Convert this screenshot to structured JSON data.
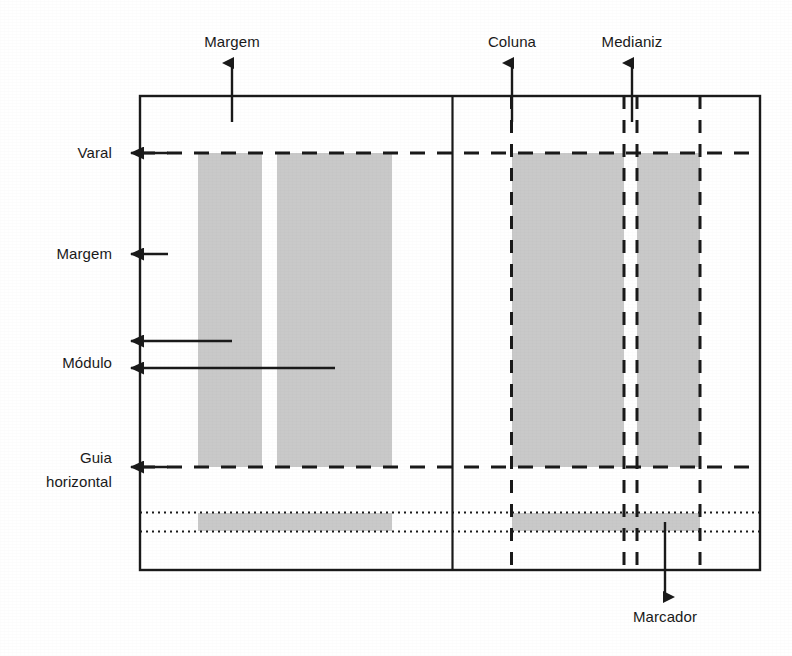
{
  "diagram": {
    "colors": {
      "stroke": "#1a1a1a",
      "fill_block": "#c9c9c9",
      "background": "#ffffff"
    },
    "labels": {
      "margem_top": "Margem",
      "coluna": "Coluna",
      "medianiz": "Medianiz",
      "varal": "Varal",
      "margem_left": "Margem",
      "modulo": "Módulo",
      "guia_line1": "Guia",
      "guia_line2": "horizontal",
      "marcador": "Marcador"
    },
    "icons": {
      "arrow_up": "arrow-up-icon",
      "arrow_left": "arrow-left-icon",
      "arrow_down": "arrow-down-icon"
    },
    "regions": {
      "page_frame": "page-frame",
      "spine": "center-spine",
      "left_text_block_1": "text-block",
      "left_text_block_2": "text-block",
      "right_text_block_1": "text-block",
      "right_text_block_2": "text-block",
      "footer_band_left": "footer-band",
      "footer_band_right": "footer-band"
    }
  }
}
